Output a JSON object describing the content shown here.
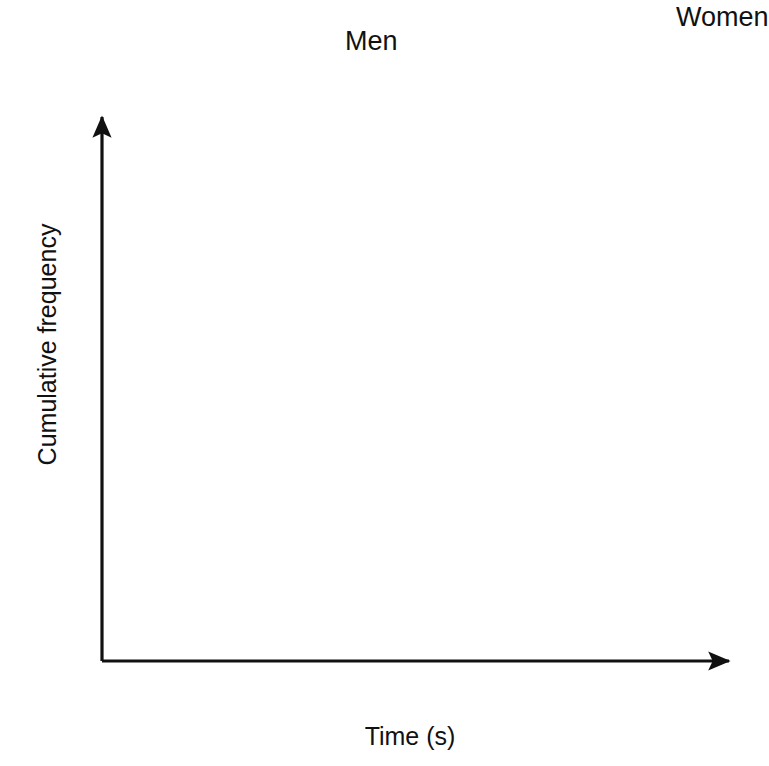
{
  "chart_data": {
    "type": "line",
    "title": "",
    "xlabel": "Time (s)",
    "ylabel": "Cumulative frequency",
    "xlim": [
      11,
      17
    ],
    "ylim": [
      0,
      50
    ],
    "xticks": [
      "11",
      "12",
      "13",
      "14",
      "15",
      "16",
      "17"
    ],
    "yticks": [
      "0",
      "10",
      "20",
      "30",
      "40",
      "50"
    ],
    "grid": "graph-paper minor 0.2s / major 1s horizontally, minor 1 / major 5 vertically",
    "legend_position": "inline-annotations-with-arrows",
    "series": [
      {
        "name": "Men",
        "color": "#e0442b",
        "points": [
          [
            11.0,
            0.0
          ],
          [
            11.2,
            0.2
          ],
          [
            11.4,
            0.5
          ],
          [
            11.6,
            0.9
          ],
          [
            11.8,
            1.4
          ],
          [
            12.0,
            2.0
          ],
          [
            12.2,
            2.9
          ],
          [
            12.4,
            4.0
          ],
          [
            12.6,
            5.4
          ],
          [
            12.8,
            7.4
          ],
          [
            13.0,
            10.0
          ],
          [
            13.1,
            11.6
          ],
          [
            13.2,
            13.4
          ],
          [
            13.3,
            15.4
          ],
          [
            13.4,
            17.5
          ],
          [
            13.5,
            19.6
          ],
          [
            13.6,
            21.6
          ],
          [
            13.7,
            23.6
          ],
          [
            13.8,
            25.8
          ],
          [
            13.9,
            28.0
          ],
          [
            14.0,
            30.0
          ],
          [
            14.1,
            31.6
          ],
          [
            14.2,
            33.0
          ],
          [
            14.3,
            34.6
          ],
          [
            14.4,
            36.2
          ],
          [
            14.5,
            37.6
          ],
          [
            14.6,
            38.8
          ],
          [
            14.7,
            39.7
          ],
          [
            14.85,
            40.4
          ]
        ]
      },
      {
        "name": "Women",
        "color": "#1f7a38",
        "points": [
          [
            12.65,
            0.0
          ],
          [
            12.8,
            0.4
          ],
          [
            13.0,
            1.0
          ],
          [
            13.2,
            1.6
          ],
          [
            13.4,
            2.2
          ],
          [
            13.6,
            3.0
          ],
          [
            13.8,
            3.9
          ],
          [
            14.0,
            5.0
          ],
          [
            14.2,
            6.2
          ],
          [
            14.4,
            7.6
          ],
          [
            14.6,
            9.2
          ],
          [
            14.8,
            11.0
          ],
          [
            15.0,
            13.0
          ],
          [
            15.2,
            15.6
          ],
          [
            15.4,
            18.4
          ],
          [
            15.6,
            21.4
          ],
          [
            15.8,
            24.4
          ],
          [
            16.0,
            27.4
          ],
          [
            16.2,
            30.4
          ],
          [
            16.4,
            33.4
          ],
          [
            16.6,
            36.2
          ],
          [
            16.8,
            39.2
          ],
          [
            16.92,
            41.0
          ]
        ]
      }
    ],
    "annotations": [
      {
        "text": "Men",
        "target_series": "Men",
        "arrow_from": [
          382,
          56
        ],
        "arrow_to": [
          484,
          223
        ]
      },
      {
        "text": "Women",
        "target_series": "Women",
        "arrow_from": [
          713,
          40
        ],
        "arrow_to": [
          714,
          214
        ]
      }
    ]
  },
  "axes": {
    "x_title": "Time (s)",
    "y_title": "Cumulative frequency",
    "x_tick_labels": [
      "11",
      "12",
      "13",
      "14",
      "15",
      "16",
      "17"
    ],
    "y_tick_labels": [
      "0",
      "10",
      "20",
      "30",
      "40",
      "50"
    ]
  },
  "annotations": {
    "men_label": "Men",
    "women_label": "Women"
  },
  "colors": {
    "men": "#e0442b",
    "women": "#1f7a38",
    "axis": "#111111",
    "grid_minor": "#b9bcc4",
    "grid_major": "#6d7078",
    "background": "#ffffff"
  }
}
